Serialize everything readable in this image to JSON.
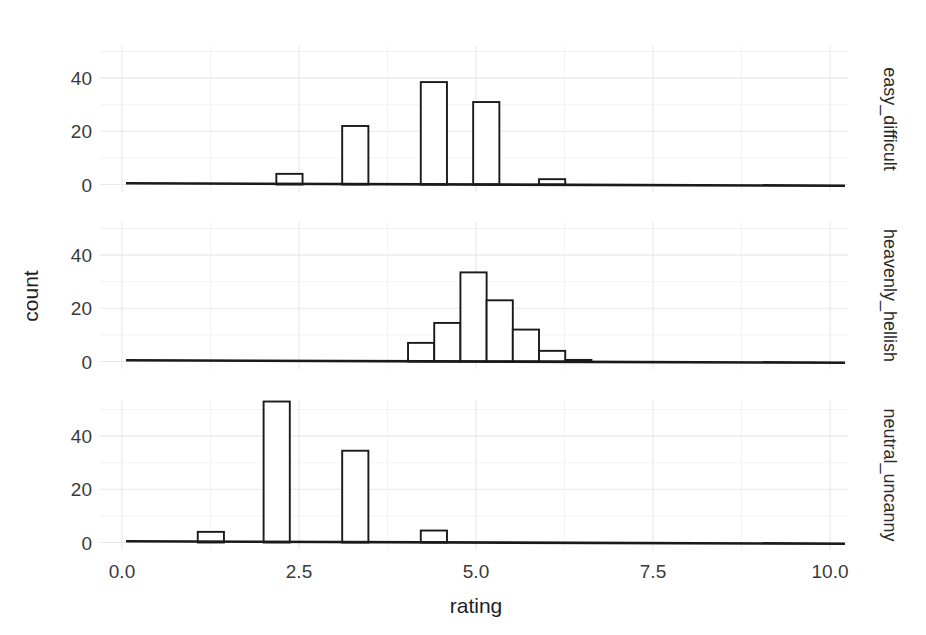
{
  "chart_data": {
    "type": "bar",
    "title": "",
    "subtitle": "",
    "xlabel": "rating",
    "ylabel": "count",
    "xlim": [
      0,
      10
    ],
    "ylim": [
      0,
      58
    ],
    "grid": true,
    "legend": null,
    "legend_position": "none",
    "facet_layout": "rows",
    "facet_label_position": "right",
    "bin_width": 0.37,
    "x_ticks": [
      "0.0",
      "2.5",
      "5.0",
      "7.5",
      "10.0"
    ],
    "x_tick_values": [
      0.0,
      2.5,
      5.0,
      7.5,
      10.0
    ],
    "y_ticks": [
      "0",
      "20",
      "40"
    ],
    "y_tick_values": [
      0,
      20,
      40
    ],
    "annotations": [],
    "facets": [
      {
        "label": "easy_difficult",
        "bars": [
          {
            "x": 2.18,
            "value": 4
          },
          {
            "x": 3.11,
            "value": 22
          },
          {
            "x": 4.22,
            "value": 38.5
          },
          {
            "x": 4.96,
            "value": 31
          },
          {
            "x": 5.89,
            "value": 2
          }
        ]
      },
      {
        "label": "heavenly_hellish",
        "bars": [
          {
            "x": 4.04,
            "value": 7
          },
          {
            "x": 4.41,
            "value": 14.5
          },
          {
            "x": 4.78,
            "value": 33.5
          },
          {
            "x": 5.15,
            "value": 23
          },
          {
            "x": 5.52,
            "value": 12
          },
          {
            "x": 5.89,
            "value": 4
          },
          {
            "x": 6.26,
            "value": 0.6
          }
        ]
      },
      {
        "label": "neutral_uncanny",
        "bars": [
          {
            "x": 1.07,
            "value": 4
          },
          {
            "x": 2.0,
            "value": 53
          },
          {
            "x": 3.11,
            "value": 34.5
          },
          {
            "x": 4.22,
            "value": 4.5
          }
        ]
      }
    ]
  },
  "colors": {
    "background": "#ffffff",
    "bar_fill": "#ffffff",
    "bar_stroke": "#1a1a1a",
    "axis": "#1a1a1a",
    "grid_major": "#e8e8e8",
    "grid_minor": "#f2f2f2",
    "text": "#2b2b2b"
  }
}
